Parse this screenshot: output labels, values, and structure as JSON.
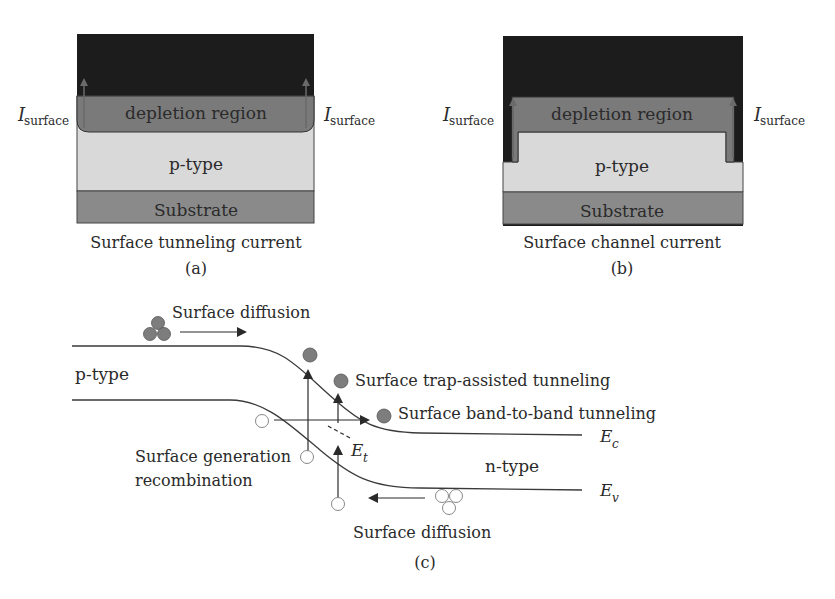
{
  "panel_a": {
    "current_label_left": "I",
    "current_label_left_sub": "surface",
    "current_label_right": "I",
    "current_label_right_sub": "surface",
    "depletion_label": "depletion region",
    "ptype_label": "p-type",
    "substrate_label": "Substrate",
    "caption": "Surface tunneling current",
    "panel_id": "(a)"
  },
  "panel_b": {
    "current_label_left": "I",
    "current_label_left_sub": "surface",
    "current_label_right": "I",
    "current_label_right_sub": "surface",
    "depletion_label": "depletion region",
    "ptype_label": "p-type",
    "substrate_label": "Substrate",
    "caption": "Surface channel current",
    "panel_id": "(b)"
  },
  "panel_c": {
    "surface_diffusion_top": "Surface diffusion",
    "ptype_label": "p-type",
    "trap_assisted": "Surface trap-assisted tunneling",
    "band_to_band": "Surface band-to-band tunneling",
    "gen_recomb_line1": "Surface generation",
    "gen_recomb_line2": "recombination",
    "trap_level": "E",
    "trap_level_sub": "t",
    "ec_label": "E",
    "ec_sub": "c",
    "ntype_label": "n-type",
    "ev_label": "E",
    "ev_sub": "v",
    "surface_diffusion_bottom": "Surface diffusion",
    "panel_id": "(c)"
  },
  "colors": {
    "metal": "#1c1c1c",
    "depletion": "#7a7a7a",
    "ptype": "#d9d9d9",
    "substrate": "#8a8a8a",
    "electron": "#7d7d7d",
    "line": "#3a3a3a"
  }
}
